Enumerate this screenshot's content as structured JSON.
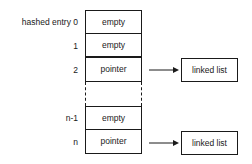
{
  "diagram": {
    "title": "",
    "rows": [
      {
        "label": "hashed entry 0",
        "value": "empty"
      },
      {
        "label": "1",
        "value": "empty"
      },
      {
        "label": "2",
        "value": "pointer",
        "points_to": "linked list"
      },
      {
        "label": "",
        "value": "",
        "ellipsis": true
      },
      {
        "label": "n-1",
        "value": "empty"
      },
      {
        "label": "n",
        "value": "pointer",
        "points_to": "linked list"
      }
    ],
    "targets": [
      {
        "label": "linked list"
      },
      {
        "label": "linked list"
      }
    ],
    "colors": {
      "line": "#1a1a1a",
      "background": "#ffffff"
    }
  }
}
